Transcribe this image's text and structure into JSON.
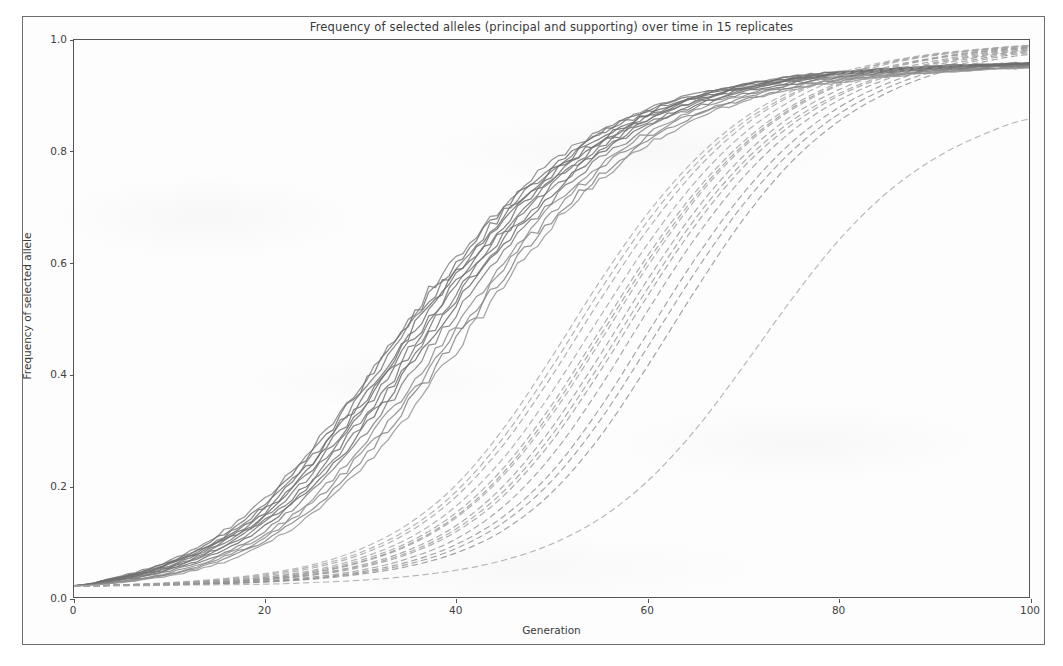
{
  "figure": {
    "title": "Frequency of selected alleles (principal and supporting) over time in 15 replicates",
    "frame_color": "#6f6f6f",
    "background_color": "#fdfdfd"
  },
  "axes": {
    "xlabel": "Generation",
    "ylabel": "Frequency of selected allele",
    "xticks": [
      "0",
      "20",
      "40",
      "60",
      "80",
      "100"
    ],
    "yticks": [
      "0.0",
      "0.2",
      "0.4",
      "0.6",
      "0.8",
      "1.0"
    ],
    "axis_color": "#555555",
    "tick_label_color": "#3f3f3f"
  },
  "chart_data": {
    "type": "line",
    "title": "Frequency of selected alleles (principal and supporting) over time in 15 replicates",
    "xlabel": "Generation",
    "ylabel": "Frequency of selected allele",
    "xlim": [
      0,
      100
    ],
    "ylim": [
      0.0,
      1.0
    ],
    "xticks": [
      0,
      20,
      40,
      60,
      80,
      100
    ],
    "yticks": [
      0.0,
      0.2,
      0.4,
      0.6,
      0.8,
      1.0
    ],
    "grid": false,
    "legend": null,
    "replicates": 15,
    "x": [
      0,
      5,
      10,
      15,
      20,
      25,
      30,
      35,
      40,
      45,
      50,
      55,
      60,
      65,
      70,
      75,
      80,
      85,
      90,
      95,
      100
    ],
    "series": [
      {
        "name": "principal-replicate-1",
        "group": "principal",
        "style": "solid",
        "color": "#6e6e6e",
        "values": [
          0.02,
          0.034,
          0.056,
          0.093,
          0.148,
          0.23,
          0.336,
          0.452,
          0.566,
          0.668,
          0.752,
          0.815,
          0.861,
          0.893,
          0.914,
          0.929,
          0.939,
          0.946,
          0.951,
          0.955,
          0.958
        ]
      },
      {
        "name": "principal-replicate-2",
        "group": "principal",
        "style": "solid",
        "color": "#727272",
        "values": [
          0.02,
          0.033,
          0.053,
          0.086,
          0.138,
          0.214,
          0.316,
          0.43,
          0.546,
          0.651,
          0.739,
          0.806,
          0.855,
          0.888,
          0.911,
          0.926,
          0.937,
          0.944,
          0.949,
          0.953,
          0.956
        ]
      },
      {
        "name": "principal-replicate-3",
        "group": "principal",
        "style": "solid",
        "color": "#787878",
        "values": [
          0.02,
          0.036,
          0.061,
          0.102,
          0.163,
          0.252,
          0.362,
          0.48,
          0.592,
          0.69,
          0.769,
          0.828,
          0.87,
          0.899,
          0.918,
          0.932,
          0.941,
          0.948,
          0.952,
          0.955,
          0.958
        ]
      },
      {
        "name": "principal-replicate-4",
        "group": "principal",
        "style": "solid",
        "color": "#6a6a6a",
        "values": [
          0.02,
          0.031,
          0.049,
          0.079,
          0.127,
          0.199,
          0.296,
          0.408,
          0.524,
          0.632,
          0.723,
          0.794,
          0.846,
          0.882,
          0.906,
          0.922,
          0.933,
          0.941,
          0.947,
          0.951,
          0.954
        ]
      },
      {
        "name": "principal-replicate-5",
        "group": "principal",
        "style": "solid",
        "color": "#818181",
        "values": [
          0.02,
          0.038,
          0.065,
          0.11,
          0.176,
          0.27,
          0.383,
          0.5,
          0.61,
          0.705,
          0.781,
          0.836,
          0.876,
          0.903,
          0.921,
          0.934,
          0.943,
          0.949,
          0.953,
          0.956,
          0.959
        ]
      },
      {
        "name": "principal-replicate-6",
        "group": "principal",
        "style": "solid",
        "color": "#747474",
        "values": [
          0.02,
          0.032,
          0.051,
          0.083,
          0.133,
          0.207,
          0.306,
          0.419,
          0.535,
          0.641,
          0.731,
          0.8,
          0.851,
          0.885,
          0.909,
          0.924,
          0.935,
          0.943,
          0.948,
          0.952,
          0.955
        ]
      },
      {
        "name": "principal-replicate-7",
        "group": "principal",
        "style": "solid",
        "color": "#8c8c8c",
        "values": [
          0.02,
          0.029,
          0.044,
          0.07,
          0.112,
          0.177,
          0.266,
          0.374,
          0.49,
          0.602,
          0.699,
          0.776,
          0.833,
          0.873,
          0.9,
          0.918,
          0.93,
          0.938,
          0.944,
          0.949,
          0.952
        ]
      },
      {
        "name": "principal-replicate-8",
        "group": "principal",
        "style": "solid",
        "color": "#6f6f6f",
        "values": [
          0.02,
          0.035,
          0.058,
          0.096,
          0.153,
          0.237,
          0.345,
          0.462,
          0.575,
          0.675,
          0.757,
          0.819,
          0.864,
          0.895,
          0.915,
          0.93,
          0.94,
          0.946,
          0.951,
          0.955,
          0.958
        ]
      },
      {
        "name": "principal-replicate-9",
        "group": "principal",
        "style": "solid",
        "color": "#7c7c7c",
        "values": [
          0.02,
          0.03,
          0.047,
          0.075,
          0.12,
          0.189,
          0.282,
          0.393,
          0.509,
          0.619,
          0.712,
          0.786,
          0.84,
          0.878,
          0.903,
          0.92,
          0.932,
          0.94,
          0.946,
          0.95,
          0.953
        ]
      },
      {
        "name": "principal-replicate-10",
        "group": "principal",
        "style": "solid",
        "color": "#8a8a8a",
        "values": [
          0.02,
          0.028,
          0.042,
          0.067,
          0.107,
          0.169,
          0.255,
          0.36,
          0.474,
          0.588,
          0.687,
          0.766,
          0.825,
          0.867,
          0.896,
          0.915,
          0.928,
          0.937,
          0.943,
          0.948,
          0.951
        ]
      },
      {
        "name": "principal-replicate-11",
        "group": "principal",
        "style": "solid",
        "color": "#717171",
        "values": [
          0.02,
          0.037,
          0.063,
          0.106,
          0.17,
          0.261,
          0.373,
          0.49,
          0.601,
          0.698,
          0.775,
          0.832,
          0.873,
          0.901,
          0.92,
          0.933,
          0.942,
          0.948,
          0.953,
          0.956,
          0.958
        ]
      },
      {
        "name": "principal-replicate-12",
        "group": "principal",
        "style": "solid",
        "color": "#767676",
        "values": [
          0.02,
          0.033,
          0.054,
          0.089,
          0.143,
          0.222,
          0.326,
          0.441,
          0.556,
          0.66,
          0.746,
          0.811,
          0.858,
          0.891,
          0.912,
          0.927,
          0.938,
          0.945,
          0.95,
          0.954,
          0.957
        ]
      },
      {
        "name": "principal-replicate-13",
        "group": "principal",
        "style": "solid",
        "color": "#838383",
        "values": [
          0.02,
          0.027,
          0.04,
          0.063,
          0.101,
          0.16,
          0.243,
          0.346,
          0.46,
          0.575,
          0.676,
          0.757,
          0.818,
          0.862,
          0.893,
          0.913,
          0.926,
          0.935,
          0.942,
          0.947,
          0.95
        ]
      },
      {
        "name": "principal-replicate-14",
        "group": "principal",
        "style": "solid",
        "color": "#6c6c6c",
        "values": [
          0.02,
          0.036,
          0.06,
          0.099,
          0.158,
          0.244,
          0.354,
          0.471,
          0.583,
          0.682,
          0.763,
          0.823,
          0.867,
          0.897,
          0.917,
          0.931,
          0.94,
          0.947,
          0.951,
          0.955,
          0.957
        ]
      },
      {
        "name": "principal-replicate-15",
        "group": "principal",
        "style": "solid",
        "color": "#959595",
        "values": [
          0.02,
          0.026,
          0.038,
          0.059,
          0.095,
          0.151,
          0.23,
          0.33,
          0.444,
          0.56,
          0.664,
          0.747,
          0.811,
          0.857,
          0.889,
          0.91,
          0.924,
          0.934,
          0.941,
          0.946,
          0.95
        ]
      },
      {
        "name": "supporting-replicate-1",
        "group": "supporting",
        "style": "dashed",
        "color": "#9a9a9a",
        "values": [
          0.02,
          0.021,
          0.023,
          0.026,
          0.031,
          0.04,
          0.055,
          0.08,
          0.122,
          0.19,
          0.29,
          0.416,
          0.552,
          0.678,
          0.779,
          0.853,
          0.903,
          0.937,
          0.959,
          0.974,
          0.984
        ]
      },
      {
        "name": "supporting-replicate-2",
        "group": "supporting",
        "style": "dashed",
        "color": "#9f9f9f",
        "values": [
          0.02,
          0.021,
          0.023,
          0.027,
          0.033,
          0.043,
          0.062,
          0.092,
          0.142,
          0.219,
          0.326,
          0.456,
          0.592,
          0.712,
          0.806,
          0.873,
          0.918,
          0.947,
          0.966,
          0.978,
          0.986
        ]
      },
      {
        "name": "supporting-replicate-3",
        "group": "supporting",
        "style": "dashed",
        "color": "#959595",
        "values": [
          0.02,
          0.021,
          0.022,
          0.025,
          0.029,
          0.036,
          0.048,
          0.069,
          0.104,
          0.163,
          0.253,
          0.374,
          0.512,
          0.643,
          0.752,
          0.834,
          0.891,
          0.929,
          0.954,
          0.97,
          0.981
        ]
      },
      {
        "name": "supporting-replicate-4",
        "group": "supporting",
        "style": "dashed",
        "color": "#a3a3a3",
        "values": [
          0.02,
          0.022,
          0.024,
          0.029,
          0.036,
          0.048,
          0.07,
          0.105,
          0.163,
          0.25,
          0.367,
          0.501,
          0.632,
          0.744,
          0.83,
          0.89,
          0.93,
          0.956,
          0.972,
          0.982,
          0.989
        ]
      },
      {
        "name": "supporting-replicate-5",
        "group": "supporting",
        "style": "dashed",
        "color": "#919191",
        "values": [
          0.02,
          0.021,
          0.022,
          0.024,
          0.027,
          0.033,
          0.043,
          0.059,
          0.087,
          0.134,
          0.208,
          0.315,
          0.447,
          0.582,
          0.703,
          0.798,
          0.866,
          0.913,
          0.944,
          0.964,
          0.977
        ]
      },
      {
        "name": "supporting-replicate-6",
        "group": "supporting",
        "style": "dashed",
        "color": "#a0a0a0",
        "values": [
          0.02,
          0.022,
          0.025,
          0.03,
          0.038,
          0.052,
          0.076,
          0.116,
          0.18,
          0.274,
          0.396,
          0.531,
          0.658,
          0.764,
          0.844,
          0.899,
          0.935,
          0.959,
          0.974,
          0.983,
          0.99
        ]
      },
      {
        "name": "supporting-replicate-7",
        "group": "supporting",
        "style": "dashed",
        "color": "#999999",
        "values": [
          0.02,
          0.021,
          0.023,
          0.026,
          0.032,
          0.041,
          0.057,
          0.084,
          0.128,
          0.2,
          0.303,
          0.432,
          0.568,
          0.692,
          0.79,
          0.862,
          0.91,
          0.942,
          0.962,
          0.976,
          0.985
        ]
      },
      {
        "name": "supporting-replicate-8",
        "group": "supporting",
        "style": "dashed",
        "color": "#8f8f8f",
        "values": [
          0.02,
          0.021,
          0.022,
          0.024,
          0.028,
          0.034,
          0.045,
          0.063,
          0.094,
          0.145,
          0.224,
          0.337,
          0.472,
          0.606,
          0.723,
          0.814,
          0.878,
          0.921,
          0.949,
          0.967,
          0.979
        ]
      },
      {
        "name": "supporting-replicate-9",
        "group": "supporting",
        "style": "dashed",
        "color": "#a6a6a6",
        "values": [
          0.02,
          0.022,
          0.026,
          0.032,
          0.042,
          0.058,
          0.086,
          0.131,
          0.201,
          0.303,
          0.43,
          0.565,
          0.687,
          0.785,
          0.858,
          0.907,
          0.94,
          0.961,
          0.975,
          0.984,
          0.99
        ]
      },
      {
        "name": "supporting-replicate-10",
        "group": "supporting",
        "style": "dashed",
        "color": "#969696",
        "values": [
          0.02,
          0.021,
          0.023,
          0.027,
          0.033,
          0.044,
          0.063,
          0.094,
          0.145,
          0.224,
          0.334,
          0.466,
          0.601,
          0.718,
          0.81,
          0.876,
          0.92,
          0.949,
          0.967,
          0.979,
          0.987
        ]
      },
      {
        "name": "supporting-replicate-11",
        "group": "supporting",
        "style": "dashed",
        "color": "#8d8d8d",
        "values": [
          0.02,
          0.021,
          0.022,
          0.024,
          0.027,
          0.032,
          0.041,
          0.055,
          0.079,
          0.12,
          0.187,
          0.286,
          0.413,
          0.549,
          0.676,
          0.779,
          0.853,
          0.904,
          0.938,
          0.96,
          0.974
        ]
      },
      {
        "name": "supporting-replicate-12",
        "group": "supporting",
        "style": "dashed",
        "color": "#a2a2a2",
        "values": [
          0.02,
          0.022,
          0.025,
          0.031,
          0.04,
          0.055,
          0.08,
          0.122,
          0.189,
          0.287,
          0.412,
          0.548,
          0.673,
          0.775,
          0.851,
          0.902,
          0.936,
          0.958,
          0.973,
          0.982,
          0.989
        ]
      },
      {
        "name": "supporting-replicate-13",
        "group": "supporting",
        "style": "dashed",
        "color": "#989898",
        "values": [
          0.02,
          0.021,
          0.023,
          0.026,
          0.031,
          0.039,
          0.053,
          0.077,
          0.117,
          0.182,
          0.279,
          0.403,
          0.539,
          0.666,
          0.77,
          0.846,
          0.899,
          0.934,
          0.957,
          0.972,
          0.982
        ]
      },
      {
        "name": "supporting-replicate-14",
        "group": "supporting",
        "style": "dashed",
        "color": "#9c9c9c",
        "values": [
          0.02,
          0.021,
          0.024,
          0.028,
          0.035,
          0.046,
          0.066,
          0.098,
          0.151,
          0.232,
          0.344,
          0.477,
          0.611,
          0.726,
          0.816,
          0.88,
          0.923,
          0.951,
          0.968,
          0.98,
          0.987
        ]
      },
      {
        "name": "supporting-replicate-15-outlier",
        "group": "supporting",
        "style": "dashed",
        "color": "#a8a8a8",
        "values": [
          0.02,
          0.02,
          0.021,
          0.022,
          0.023,
          0.026,
          0.03,
          0.037,
          0.048,
          0.066,
          0.095,
          0.14,
          0.207,
          0.299,
          0.412,
          0.531,
          0.639,
          0.724,
          0.786,
          0.829,
          0.858
        ]
      }
    ]
  }
}
